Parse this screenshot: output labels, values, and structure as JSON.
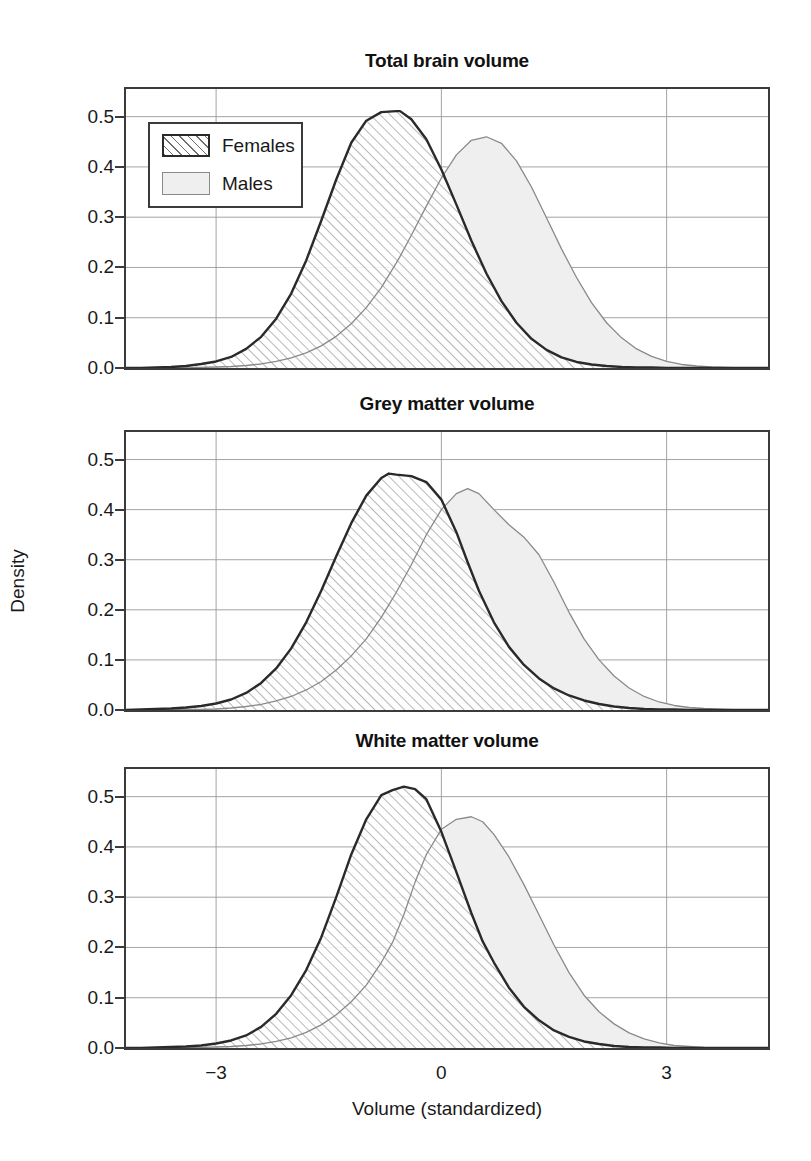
{
  "figure": {
    "ylabel": "Density",
    "xlabel": "Volume (standardized)"
  },
  "legend": {
    "females_label": "Females",
    "males_label": "Males"
  },
  "colors": {
    "females_line": "#2a2a2a",
    "females_hatch": "#6d6d6d",
    "males_line": "#8a8a8a",
    "males_fill": "#efefef",
    "axis": "#3b3b3b",
    "grid": "#9a9a9a"
  },
  "axes": {
    "yticks": [
      "0.0",
      "0.1",
      "0.2",
      "0.3",
      "0.4",
      "0.5"
    ],
    "ytick_values": [
      0.0,
      0.1,
      0.2,
      0.3,
      0.4,
      0.5
    ],
    "xticks": [
      "−3",
      "0",
      "3"
    ],
    "xtick_values": [
      -3,
      0,
      3
    ],
    "xlim": [
      -4.2,
      4.35
    ],
    "ylim": [
      0.0,
      0.555
    ]
  },
  "panels": [
    {
      "id": "total-brain-volume",
      "title": "Total brain volume"
    },
    {
      "id": "grey-matter-volume",
      "title": "Grey matter volume"
    },
    {
      "id": "white-matter-volume",
      "title": "White matter volume"
    }
  ],
  "chart_data": [
    {
      "type": "area",
      "title": "Total brain volume",
      "xlabel": "Volume (standardized)",
      "ylabel": "Density",
      "xlim": [
        -4.2,
        4.35
      ],
      "ylim": [
        0.0,
        0.555
      ],
      "grid": true,
      "legend_position": "upper-left",
      "x": [
        -4.2,
        -4.0,
        -3.8,
        -3.6,
        -3.4,
        -3.2,
        -3.0,
        -2.8,
        -2.6,
        -2.4,
        -2.2,
        -2.0,
        -1.8,
        -1.6,
        -1.4,
        -1.2,
        -1.0,
        -0.8,
        -0.6,
        -0.55,
        -0.4,
        -0.2,
        0.0,
        0.2,
        0.4,
        0.6,
        0.8,
        1.0,
        1.2,
        1.4,
        1.6,
        1.8,
        2.0,
        2.2,
        2.4,
        2.6,
        2.8,
        3.0,
        3.2,
        3.4,
        3.6,
        3.8,
        4.0,
        4.35
      ],
      "series": [
        {
          "name": "Females",
          "values": [
            0.0,
            0.0,
            0.001,
            0.002,
            0.004,
            0.008,
            0.013,
            0.022,
            0.038,
            0.062,
            0.098,
            0.148,
            0.214,
            0.293,
            0.375,
            0.448,
            0.492,
            0.509,
            0.511,
            0.511,
            0.495,
            0.455,
            0.395,
            0.325,
            0.253,
            0.188,
            0.133,
            0.09,
            0.058,
            0.036,
            0.021,
            0.012,
            0.007,
            0.004,
            0.002,
            0.001,
            0.001,
            0.0,
            0.0,
            0.0,
            0.0,
            0.0,
            0.0,
            0.0
          ]
        },
        {
          "name": "Males",
          "values": [
            0.0,
            0.0,
            0.0,
            0.0,
            0.0,
            0.001,
            0.002,
            0.003,
            0.005,
            0.008,
            0.013,
            0.02,
            0.03,
            0.044,
            0.063,
            0.088,
            0.12,
            0.16,
            0.209,
            0.222,
            0.264,
            0.322,
            0.378,
            0.424,
            0.453,
            0.46,
            0.447,
            0.412,
            0.36,
            0.299,
            0.237,
            0.18,
            0.13,
            0.09,
            0.06,
            0.038,
            0.023,
            0.013,
            0.007,
            0.004,
            0.002,
            0.001,
            0.0,
            0.0
          ]
        }
      ]
    },
    {
      "type": "area",
      "title": "Grey matter volume",
      "xlabel": "Volume (standardized)",
      "ylabel": "Density",
      "xlim": [
        -4.2,
        4.35
      ],
      "ylim": [
        0.0,
        0.555
      ],
      "grid": true,
      "x": [
        -4.2,
        -4.0,
        -3.8,
        -3.6,
        -3.4,
        -3.2,
        -3.0,
        -2.8,
        -2.6,
        -2.4,
        -2.2,
        -2.0,
        -1.8,
        -1.6,
        -1.4,
        -1.2,
        -1.0,
        -0.8,
        -0.7,
        -0.6,
        -0.4,
        -0.2,
        0.0,
        0.2,
        0.35,
        0.5,
        0.7,
        0.9,
        1.1,
        1.3,
        1.5,
        1.7,
        1.9,
        2.1,
        2.3,
        2.5,
        2.7,
        2.9,
        3.1,
        3.3,
        3.5,
        3.8,
        4.0,
        4.35
      ],
      "series": [
        {
          "name": "Females",
          "values": [
            0.0,
            0.001,
            0.002,
            0.003,
            0.005,
            0.008,
            0.013,
            0.021,
            0.034,
            0.054,
            0.083,
            0.123,
            0.175,
            0.238,
            0.307,
            0.373,
            0.428,
            0.463,
            0.472,
            0.47,
            0.467,
            0.455,
            0.42,
            0.355,
            0.295,
            0.238,
            0.175,
            0.126,
            0.09,
            0.063,
            0.043,
            0.029,
            0.019,
            0.012,
            0.007,
            0.004,
            0.002,
            0.001,
            0.001,
            0.0,
            0.0,
            0.0,
            0.0,
            0.0
          ]
        },
        {
          "name": "Males",
          "values": [
            0.0,
            0.0,
            0.0,
            0.0,
            0.001,
            0.001,
            0.002,
            0.004,
            0.007,
            0.011,
            0.018,
            0.027,
            0.04,
            0.057,
            0.08,
            0.108,
            0.142,
            0.185,
            0.21,
            0.235,
            0.29,
            0.35,
            0.4,
            0.432,
            0.442,
            0.432,
            0.4,
            0.37,
            0.345,
            0.31,
            0.255,
            0.195,
            0.142,
            0.1,
            0.068,
            0.044,
            0.027,
            0.016,
            0.009,
            0.005,
            0.003,
            0.001,
            0.0,
            0.0
          ]
        }
      ]
    },
    {
      "type": "area",
      "title": "White matter volume",
      "xlabel": "Volume (standardized)",
      "ylabel": "Density",
      "xlim": [
        -4.2,
        4.35
      ],
      "ylim": [
        0.0,
        0.555
      ],
      "grid": true,
      "x": [
        -4.2,
        -4.0,
        -3.8,
        -3.6,
        -3.4,
        -3.2,
        -3.0,
        -2.8,
        -2.6,
        -2.4,
        -2.2,
        -2.0,
        -1.8,
        -1.6,
        -1.4,
        -1.2,
        -1.0,
        -0.8,
        -0.65,
        -0.5,
        -0.35,
        -0.2,
        0.0,
        0.2,
        0.4,
        0.55,
        0.7,
        0.9,
        1.1,
        1.3,
        1.5,
        1.7,
        1.9,
        2.1,
        2.3,
        2.5,
        2.7,
        2.9,
        3.1,
        3.3,
        3.5,
        3.8,
        4.0,
        4.35
      ],
      "series": [
        {
          "name": "Females",
          "values": [
            0.0,
            0.0,
            0.001,
            0.002,
            0.003,
            0.005,
            0.009,
            0.015,
            0.025,
            0.042,
            0.068,
            0.105,
            0.155,
            0.22,
            0.3,
            0.385,
            0.455,
            0.503,
            0.513,
            0.52,
            0.515,
            0.495,
            0.43,
            0.35,
            0.268,
            0.212,
            0.17,
            0.12,
            0.082,
            0.055,
            0.035,
            0.022,
            0.013,
            0.008,
            0.004,
            0.002,
            0.001,
            0.001,
            0.0,
            0.0,
            0.0,
            0.0,
            0.0,
            0.0
          ]
        },
        {
          "name": "Males",
          "values": [
            0.0,
            0.0,
            0.0,
            0.0,
            0.0,
            0.001,
            0.002,
            0.003,
            0.005,
            0.008,
            0.013,
            0.02,
            0.031,
            0.046,
            0.066,
            0.092,
            0.125,
            0.17,
            0.21,
            0.265,
            0.33,
            0.385,
            0.435,
            0.455,
            0.46,
            0.45,
            0.425,
            0.38,
            0.325,
            0.265,
            0.205,
            0.15,
            0.105,
            0.072,
            0.048,
            0.03,
            0.018,
            0.01,
            0.005,
            0.003,
            0.001,
            0.0,
            0.0,
            0.0
          ]
        }
      ]
    }
  ]
}
